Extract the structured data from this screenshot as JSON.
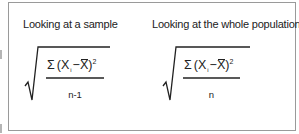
{
  "figure": {
    "left_panel": {
      "title": "Looking at a sample",
      "formula": {
        "sum_symbol": "Σ",
        "open_paren": "(",
        "x_var": "X",
        "subscript": "i",
        "minus": "−",
        "mean_var": "X",
        "close_paren": ")",
        "exponent": "2",
        "denominator": "n-1"
      }
    },
    "right_panel": {
      "title": "Looking at the whole population",
      "formula": {
        "sum_symbol": "Σ",
        "open_paren": "(",
        "x_var": "X",
        "subscript": "i",
        "minus": "−",
        "mean_var": "X",
        "close_paren": ")",
        "exponent": "2",
        "denominator": "n"
      }
    },
    "colors": {
      "border": "#9a9a9a",
      "text": "#222222",
      "background": "#ffffff"
    }
  }
}
